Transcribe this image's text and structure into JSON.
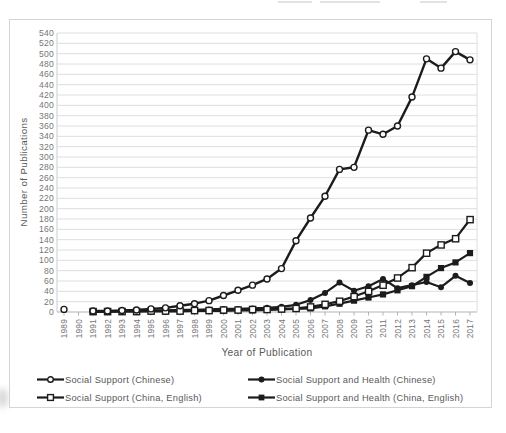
{
  "figure": {
    "ylabel": "Number of Publications",
    "xlabel": "Year of Publication"
  },
  "legend": {
    "items": [
      {
        "label": "Social Support (Chinese)",
        "marker": "open-circle"
      },
      {
        "label": "Social Support and Health (Chinese)",
        "marker": "filled-circle"
      },
      {
        "label": "Social Support (China, English)",
        "marker": "open-square"
      },
      {
        "label": "Social Support and Health (China, English)",
        "marker": "filled-square"
      }
    ]
  },
  "chart_data": {
    "type": "line",
    "title": "",
    "xlabel": "Year of Publication",
    "ylabel": "Number of Publications",
    "x": [
      1989,
      1990,
      1991,
      1992,
      1993,
      1994,
      1995,
      1996,
      1997,
      1998,
      1999,
      2000,
      2001,
      2002,
      2003,
      2004,
      2005,
      2006,
      2007,
      2008,
      2009,
      2010,
      2011,
      2012,
      2013,
      2014,
      2015,
      2016,
      2017
    ],
    "ylim": [
      0,
      540
    ],
    "ytick_step": 20,
    "grid": true,
    "legend_position": "bottom",
    "series": [
      {
        "name": "Social Support (Chinese)",
        "marker": "open-circle",
        "values": [
          5,
          null,
          2,
          2,
          3,
          4,
          6,
          8,
          12,
          16,
          22,
          32,
          42,
          52,
          64,
          84,
          138,
          182,
          224,
          276,
          280,
          352,
          344,
          360,
          416,
          490,
          472,
          504,
          488
        ]
      },
      {
        "name": "Social Support and Health (Chinese)",
        "marker": "filled-circle",
        "values": [
          null,
          null,
          1,
          1,
          2,
          2,
          3,
          3,
          4,
          4,
          5,
          6,
          6,
          7,
          8,
          10,
          14,
          23,
          37,
          57,
          41,
          50,
          64,
          46,
          52,
          58,
          48,
          70,
          56
        ]
      },
      {
        "name": "Social Support (China, English)",
        "marker": "open-square",
        "values": [
          null,
          null,
          1,
          1,
          1,
          1,
          2,
          2,
          2,
          3,
          3,
          4,
          4,
          5,
          5,
          6,
          7,
          10,
          15,
          21,
          30,
          40,
          52,
          66,
          86,
          114,
          130,
          142,
          179
        ]
      },
      {
        "name": "Social Support and Health (China, English)",
        "marker": "filled-square",
        "values": [
          null,
          null,
          0,
          0,
          1,
          1,
          1,
          1,
          1,
          2,
          2,
          2,
          3,
          3,
          4,
          5,
          6,
          7,
          11,
          16,
          22,
          28,
          34,
          42,
          50,
          68,
          85,
          96,
          114
        ]
      }
    ],
    "colors": {
      "series": "#1c1c1c",
      "grid": "#dedede",
      "axis": "#b3b3b3",
      "tick_text": "#767676",
      "title_text": "#595959"
    }
  }
}
